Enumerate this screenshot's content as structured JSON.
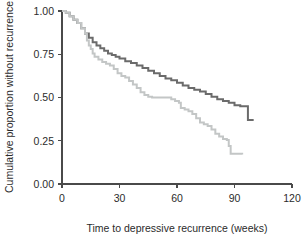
{
  "chart_data": {
    "type": "line",
    "title": "",
    "xlabel": "Time to depressive recurrence (weeks)",
    "ylabel": "Cumulative proportion without recurrence",
    "xlim": [
      0,
      120
    ],
    "ylim": [
      0.0,
      1.0
    ],
    "xticks": [
      0,
      30,
      60,
      90,
      120
    ],
    "xtick_labels": [
      "0",
      "30",
      "60",
      "90",
      "120"
    ],
    "yticks": [
      0.0,
      0.25,
      0.5,
      0.75,
      1.0
    ],
    "ytick_labels": [
      "0.00",
      "0.25",
      "0.50",
      "0.75",
      "1.00"
    ],
    "grid": false,
    "legend": "none",
    "series": [
      {
        "name": "dark-group",
        "color": "#6b6b6b",
        "stroke_width": 2.0,
        "step": "post",
        "points": [
          [
            0,
            1.0
          ],
          [
            2,
            0.99
          ],
          [
            4,
            0.97
          ],
          [
            6,
            0.95
          ],
          [
            8,
            0.93
          ],
          [
            10,
            0.9
          ],
          [
            12,
            0.87
          ],
          [
            14,
            0.845
          ],
          [
            16,
            0.82
          ],
          [
            18,
            0.8
          ],
          [
            20,
            0.785
          ],
          [
            22,
            0.77
          ],
          [
            24,
            0.755
          ],
          [
            26,
            0.745
          ],
          [
            28,
            0.735
          ],
          [
            30,
            0.725
          ],
          [
            33,
            0.71
          ],
          [
            36,
            0.7
          ],
          [
            39,
            0.685
          ],
          [
            42,
            0.67
          ],
          [
            45,
            0.655
          ],
          [
            48,
            0.64
          ],
          [
            51,
            0.625
          ],
          [
            54,
            0.61
          ],
          [
            57,
            0.6
          ],
          [
            60,
            0.585
          ],
          [
            63,
            0.57
          ],
          [
            66,
            0.555
          ],
          [
            69,
            0.545
          ],
          [
            72,
            0.535
          ],
          [
            75,
            0.52
          ],
          [
            78,
            0.505
          ],
          [
            81,
            0.49
          ],
          [
            84,
            0.48
          ],
          [
            87,
            0.47
          ],
          [
            90,
            0.455
          ],
          [
            93,
            0.45
          ],
          [
            96,
            0.45
          ],
          [
            97,
            0.37
          ],
          [
            100,
            0.37
          ]
        ]
      },
      {
        "name": "light-group",
        "color": "#c3c6c6",
        "stroke_width": 2.0,
        "step": "post",
        "points": [
          [
            0,
            1.0
          ],
          [
            2,
            0.99
          ],
          [
            4,
            0.97
          ],
          [
            6,
            0.95
          ],
          [
            8,
            0.93
          ],
          [
            10,
            0.9
          ],
          [
            12,
            0.87
          ],
          [
            13,
            0.83
          ],
          [
            14,
            0.8
          ],
          [
            15,
            0.78
          ],
          [
            16,
            0.755
          ],
          [
            17,
            0.735
          ],
          [
            19,
            0.72
          ],
          [
            21,
            0.705
          ],
          [
            23,
            0.695
          ],
          [
            25,
            0.685
          ],
          [
            27,
            0.665
          ],
          [
            29,
            0.64
          ],
          [
            31,
            0.625
          ],
          [
            33,
            0.615
          ],
          [
            35,
            0.595
          ],
          [
            37,
            0.575
          ],
          [
            39,
            0.555
          ],
          [
            41,
            0.53
          ],
          [
            43,
            0.515
          ],
          [
            45,
            0.505
          ],
          [
            47,
            0.5
          ],
          [
            50,
            0.5
          ],
          [
            53,
            0.5
          ],
          [
            55,
            0.5
          ],
          [
            57,
            0.49
          ],
          [
            59,
            0.48
          ],
          [
            61,
            0.47
          ],
          [
            62,
            0.44
          ],
          [
            64,
            0.43
          ],
          [
            66,
            0.42
          ],
          [
            68,
            0.405
          ],
          [
            70,
            0.38
          ],
          [
            72,
            0.355
          ],
          [
            74,
            0.345
          ],
          [
            76,
            0.335
          ],
          [
            78,
            0.315
          ],
          [
            80,
            0.29
          ],
          [
            82,
            0.275
          ],
          [
            84,
            0.26
          ],
          [
            86,
            0.255
          ],
          [
            87,
            0.22
          ],
          [
            88,
            0.175
          ],
          [
            94,
            0.17
          ]
        ]
      }
    ]
  },
  "plot_geometry": {
    "left_px": 62,
    "right_px": 292,
    "top_px": 11,
    "bottom_px": 184
  }
}
